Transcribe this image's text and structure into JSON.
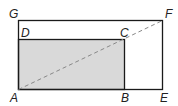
{
  "diagram": {
    "type": "geometry-rectangles",
    "labels": {
      "A": "A",
      "B": "B",
      "C": "C",
      "D": "D",
      "E": "E",
      "F": "F",
      "G": "G"
    },
    "colors": {
      "stroke": "#1a1a1a",
      "shade": "#d9d9d9",
      "dashed": "#888888"
    }
  }
}
